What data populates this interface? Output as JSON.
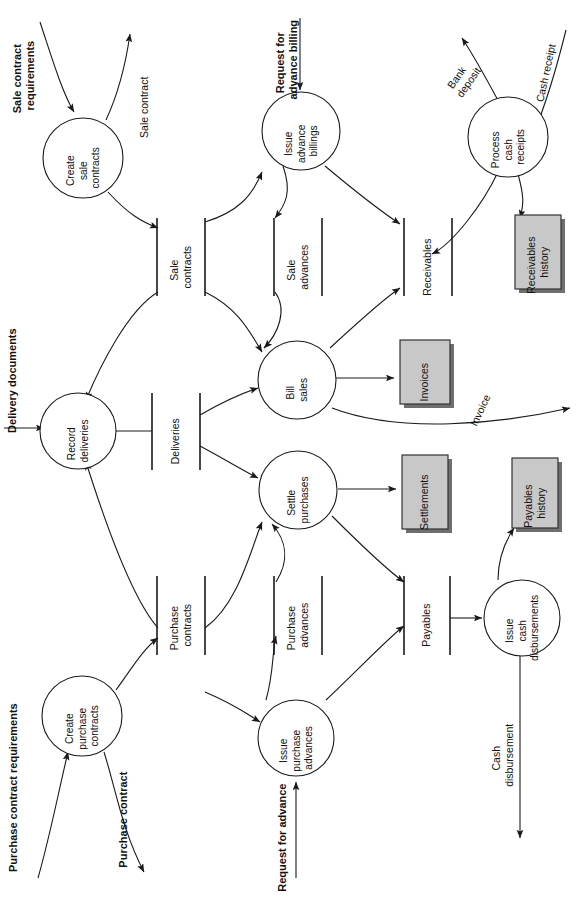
{
  "diagram": {
    "orientation": "rotated-90-ccw",
    "colors": {
      "stroke": "#1a1a1a",
      "external_fill": "#c8c8c8",
      "external_shadow": "#6f6f6f",
      "background": "#ffffff"
    },
    "processes": [
      {
        "id": "create-sale-contracts",
        "lines": [
          "Create",
          "sale",
          "contracts"
        ]
      },
      {
        "id": "issue-advance-billings",
        "lines": [
          "Issue",
          "advance",
          "billings"
        ]
      },
      {
        "id": "process-cash-receipts",
        "lines": [
          "Process",
          "cash",
          "receipts"
        ]
      },
      {
        "id": "record-deliveries",
        "lines": [
          "Record",
          "deliveries"
        ]
      },
      {
        "id": "bill-sales",
        "lines": [
          "Bill",
          "sales"
        ]
      },
      {
        "id": "settle-purchases",
        "lines": [
          "Settle",
          "purchases"
        ]
      },
      {
        "id": "create-purchase-contracts",
        "lines": [
          "Create",
          "purchase",
          "contracts"
        ]
      },
      {
        "id": "issue-purchase-advances",
        "lines": [
          "Issue",
          "purchase",
          "advances"
        ]
      },
      {
        "id": "issue-cash-disbursements",
        "lines": [
          "Issue",
          "cash",
          "disbursements"
        ]
      }
    ],
    "datastores": [
      {
        "id": "sale-contracts",
        "lines": [
          "Sale",
          "contracts"
        ]
      },
      {
        "id": "sale-advances",
        "lines": [
          "Sale",
          "advances"
        ]
      },
      {
        "id": "receivables",
        "lines": [
          "Receivables"
        ]
      },
      {
        "id": "deliveries",
        "lines": [
          "Deliveries"
        ]
      },
      {
        "id": "purchase-contracts",
        "lines": [
          "Purchase",
          "contracts"
        ]
      },
      {
        "id": "purchase-advances",
        "lines": [
          "Purchase",
          "advances"
        ]
      },
      {
        "id": "payables",
        "lines": [
          "Payables"
        ]
      }
    ],
    "externals": [
      {
        "id": "invoices",
        "lines": [
          "Invoices"
        ]
      },
      {
        "id": "settlements",
        "lines": [
          "Settlements"
        ]
      },
      {
        "id": "receivables-history",
        "lines": [
          "Receivables",
          "history"
        ]
      },
      {
        "id": "payables-history",
        "lines": [
          "Payables",
          "history"
        ]
      }
    ],
    "flows": [
      {
        "id": "sale-contract-requirements",
        "lines": [
          "Sale contract",
          "requirements"
        ]
      },
      {
        "id": "sale-contract",
        "lines": [
          "Sale contract"
        ]
      },
      {
        "id": "request-for-advance-billing",
        "lines": [
          "Request for",
          "advance billing"
        ]
      },
      {
        "id": "bank-deposit",
        "lines": [
          "Bank",
          "deposit"
        ]
      },
      {
        "id": "cash-receipt",
        "lines": [
          "Cash receipt"
        ]
      },
      {
        "id": "delivery-documents",
        "lines": [
          "Delivery documents"
        ]
      },
      {
        "id": "invoice",
        "lines": [
          "Invoice"
        ]
      },
      {
        "id": "purchase-contract-requirements",
        "lines": [
          "Purchase contract requirements"
        ]
      },
      {
        "id": "purchase-contract",
        "lines": [
          "Purchase contract"
        ]
      },
      {
        "id": "request-for-advance",
        "lines": [
          "Request for advance"
        ]
      },
      {
        "id": "cash-disbursement",
        "lines": [
          "Cash",
          "disbursement"
        ]
      }
    ]
  }
}
